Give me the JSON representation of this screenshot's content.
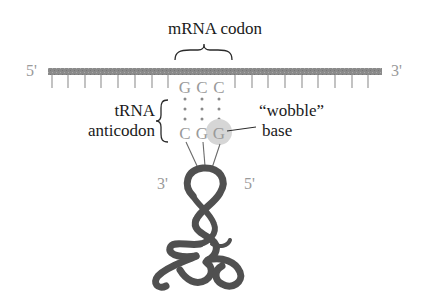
{
  "title": "mRNA codon",
  "mrna": {
    "five_prime_label": "5'",
    "three_prime_label": "3'",
    "codon_bases": [
      "G",
      "C",
      "C"
    ],
    "strand_color": "#8a8a8a"
  },
  "trna": {
    "label_line1": "tRNA",
    "label_line2": "anticodon",
    "anticodon_bases": [
      "C",
      "G",
      "G"
    ],
    "three_prime_label": "3'",
    "five_prime_label": "5'",
    "ribbon_color": "#505050"
  },
  "wobble": {
    "label_line1": "“wobble”",
    "label_line2": "base",
    "highlight_color": "#d4d4d4"
  },
  "colors": {
    "base_letters": "#9a9a9a",
    "text": "#1a1a1a"
  }
}
